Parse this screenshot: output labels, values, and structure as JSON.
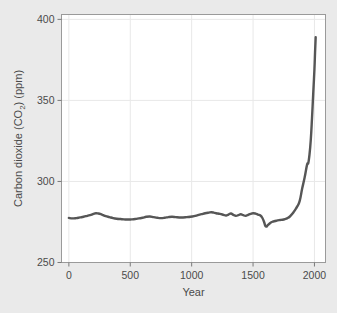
{
  "figure": {
    "background_color": "#eaeaea",
    "plot_background_color": "#ffffff",
    "border_color": "#9a9a9a",
    "gridline_color": "#e8e8e8",
    "clipped_header_text": ""
  },
  "chart_data": {
    "type": "line",
    "title": "",
    "subtitle": "",
    "xlabel": "Year",
    "ylabel": "Carbon dioxide (CO2) (ppm)",
    "ylabel_display": "Carbon dioxide (CO₂) (ppm)",
    "xlim": [
      -60,
      2090
    ],
    "ylim": [
      250,
      403
    ],
    "xticks": [
      0,
      500,
      1000,
      1500,
      2000
    ],
    "xtick_labels": [
      "0",
      "500",
      "1000",
      "1500",
      "2000"
    ],
    "yticks": [
      250,
      300,
      350,
      400
    ],
    "ytick_labels": [
      "250",
      "300",
      "350",
      "400"
    ],
    "grid": true,
    "grid_axis": "both",
    "legend": false,
    "legend_position": "none",
    "line_color": "#565656",
    "line_width": 2.4,
    "series": [
      {
        "name": "Atmospheric CO2 concentration",
        "units": "ppm",
        "x": [
          0,
          30,
          60,
          90,
          120,
          150,
          180,
          200,
          220,
          240,
          260,
          280,
          300,
          330,
          360,
          390,
          420,
          450,
          480,
          510,
          540,
          570,
          600,
          630,
          660,
          690,
          720,
          750,
          780,
          810,
          840,
          870,
          900,
          930,
          960,
          990,
          1020,
          1050,
          1080,
          1110,
          1140,
          1160,
          1180,
          1200,
          1230,
          1260,
          1280,
          1300,
          1320,
          1340,
          1360,
          1380,
          1400,
          1420,
          1440,
          1460,
          1480,
          1500,
          1520,
          1540,
          1560,
          1575,
          1590,
          1600,
          1610,
          1620,
          1640,
          1660,
          1680,
          1700,
          1720,
          1740,
          1760,
          1780,
          1800,
          1820,
          1840,
          1860,
          1880,
          1900,
          1920,
          1940,
          1950,
          1960,
          1970,
          1980,
          1990,
          2000,
          2005,
          2010
        ],
        "y": [
          277.5,
          277.2,
          277.4,
          277.8,
          278.2,
          278.8,
          279.4,
          280.0,
          280.4,
          280.2,
          279.8,
          279.2,
          278.6,
          278.0,
          277.4,
          277.0,
          276.8,
          276.6,
          276.5,
          276.6,
          276.8,
          277.2,
          277.6,
          278.2,
          278.4,
          278.0,
          277.6,
          277.4,
          277.6,
          278.0,
          278.2,
          278.0,
          277.8,
          277.8,
          278.0,
          278.2,
          278.6,
          279.2,
          279.8,
          280.4,
          280.8,
          281.0,
          280.8,
          280.4,
          280.0,
          279.4,
          279.0,
          279.6,
          280.2,
          279.4,
          278.8,
          279.2,
          279.8,
          279.2,
          278.8,
          279.4,
          280.0,
          280.4,
          280.2,
          279.6,
          279.0,
          277.6,
          275.0,
          272.6,
          272.2,
          273.0,
          274.4,
          275.2,
          275.6,
          276.0,
          276.2,
          276.4,
          276.8,
          277.4,
          278.4,
          280.0,
          282.2,
          284.6,
          288.0,
          295.6,
          302.4,
          310.4,
          311.4,
          316.8,
          325.6,
          338.8,
          354.2,
          369.4,
          379.8,
          389.0
        ]
      }
    ],
    "annotations": []
  }
}
